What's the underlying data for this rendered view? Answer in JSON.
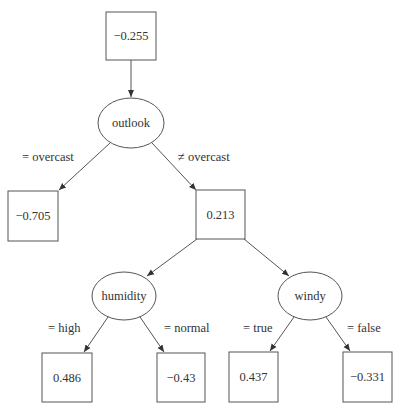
{
  "diagram": {
    "type": "decision-tree",
    "nodes": [
      {
        "id": "root",
        "kind": "leaf-value",
        "label": "−0.255"
      },
      {
        "id": "outlook",
        "kind": "split",
        "label": "outlook"
      },
      {
        "id": "overcast_leaf",
        "kind": "leaf-value",
        "label": "−0.705"
      },
      {
        "id": "mid",
        "kind": "leaf-value",
        "label": "0.213"
      },
      {
        "id": "humidity",
        "kind": "split",
        "label": "humidity"
      },
      {
        "id": "windy",
        "kind": "split",
        "label": "windy"
      },
      {
        "id": "high_leaf",
        "kind": "leaf-value",
        "label": "0.486"
      },
      {
        "id": "normal_leaf",
        "kind": "leaf-value",
        "label": "−0.43"
      },
      {
        "id": "true_leaf",
        "kind": "leaf-value",
        "label": "0.437"
      },
      {
        "id": "false_leaf",
        "kind": "leaf-value",
        "label": "−0.331"
      }
    ],
    "edges": [
      {
        "from": "root",
        "to": "outlook",
        "label": ""
      },
      {
        "from": "outlook",
        "to": "overcast_leaf",
        "label": "= overcast"
      },
      {
        "from": "outlook",
        "to": "mid",
        "label": "≠ overcast"
      },
      {
        "from": "mid",
        "to": "humidity",
        "label": ""
      },
      {
        "from": "mid",
        "to": "windy",
        "label": ""
      },
      {
        "from": "humidity",
        "to": "high_leaf",
        "label": "= high"
      },
      {
        "from": "humidity",
        "to": "normal_leaf",
        "label": "= normal"
      },
      {
        "from": "windy",
        "to": "true_leaf",
        "label": "= true"
      },
      {
        "from": "windy",
        "to": "false_leaf",
        "label": "= false"
      }
    ]
  }
}
